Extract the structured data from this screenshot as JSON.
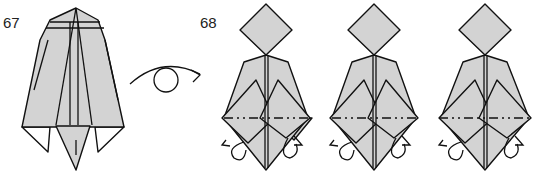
{
  "diagram": {
    "type": "origami-instructions",
    "steps": [
      {
        "number": "67",
        "description": "Folded model front view; turn over"
      },
      {
        "number": "68",
        "description": "Mountain-fold the flaps behind along the dash-dot lines (three progressive views)"
      }
    ],
    "symbols": [
      {
        "name": "turn-over-icon",
        "meaning": "turn the model over"
      },
      {
        "name": "mountain-fold-line",
        "meaning": "mountain fold"
      },
      {
        "name": "fold-behind-arrow-icon",
        "meaning": "fold behind"
      }
    ],
    "colors": {
      "paper": "#d3d3d3",
      "outline": "#111111",
      "background": "#ffffff"
    }
  }
}
